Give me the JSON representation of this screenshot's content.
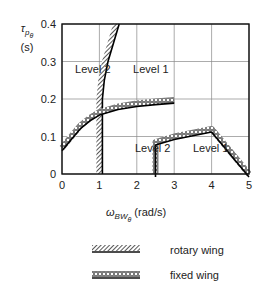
{
  "chart_data": {
    "type": "line",
    "title": "",
    "xlabel": "ω_BWθ (rad/s)",
    "ylabel": "τ_pθ (s)",
    "xlim": [
      0,
      5
    ],
    "ylim": [
      0,
      0.4
    ],
    "x_ticks": [
      "0",
      "1",
      "2",
      "3",
      "4",
      "5"
    ],
    "y_ticks": [
      "0",
      "0.1",
      "0.2",
      "0.3",
      "0.4"
    ],
    "grid": true,
    "legend_position": "below",
    "series": [
      {
        "name": "rotary wing",
        "style": "hatched",
        "points": [
          [
            1.0,
            0.0
          ],
          [
            1.0,
            0.2
          ],
          [
            1.05,
            0.25
          ],
          [
            1.15,
            0.3
          ],
          [
            1.3,
            0.35
          ],
          [
            1.45,
            0.4
          ]
        ]
      },
      {
        "name": "fixed wing (upper boundary)",
        "style": "cross-hatched",
        "points": [
          [
            0.0,
            0.07
          ],
          [
            0.25,
            0.1
          ],
          [
            0.5,
            0.13
          ],
          [
            0.75,
            0.15
          ],
          [
            1.0,
            0.165
          ],
          [
            1.5,
            0.18
          ],
          [
            2.0,
            0.188
          ],
          [
            2.5,
            0.193
          ],
          [
            3.0,
            0.197
          ]
        ]
      },
      {
        "name": "fixed wing (lower boundary)",
        "style": "cross-hatched",
        "points": [
          [
            2.5,
            0.0
          ],
          [
            2.5,
            0.085
          ],
          [
            3.0,
            0.1
          ],
          [
            3.5,
            0.11
          ],
          [
            4.0,
            0.12
          ],
          [
            5.0,
            0.0
          ]
        ]
      }
    ],
    "annotations": [
      {
        "text": "Level 2",
        "x": 0.35,
        "y": 0.27
      },
      {
        "text": "Level 1",
        "x": 1.9,
        "y": 0.27
      },
      {
        "text": "Level 2",
        "x": 1.95,
        "y": 0.06
      },
      {
        "text": "Level 1",
        "x": 3.5,
        "y": 0.06
      }
    ]
  },
  "axis": {
    "y_symbol": "τ",
    "y_sub": "p",
    "y_subsub": "θ",
    "y_unit": "(s)",
    "x_symbol": "ω",
    "x_sub": "BW",
    "x_subsub": "θ",
    "x_unit": "(rad/s)"
  },
  "legend": {
    "rotary": "rotary wing",
    "fixed": "fixed wing"
  }
}
